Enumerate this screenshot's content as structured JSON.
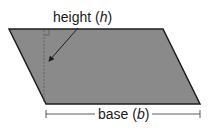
{
  "diagram": {
    "shape": "parallelogram",
    "fill_color": "#8a8a8a",
    "stroke_color": "#1e1e1e",
    "labels": {
      "height": "height (",
      "height_var": "h",
      "height_close": ")",
      "base": "base (",
      "base_var": "b",
      "base_close": ")"
    },
    "vertices": {
      "top_left": [
        9,
        29
      ],
      "top_right": [
        163,
        29
      ],
      "bottom_right": [
        200,
        104
      ],
      "bottom_left": [
        46,
        104
      ]
    }
  }
}
